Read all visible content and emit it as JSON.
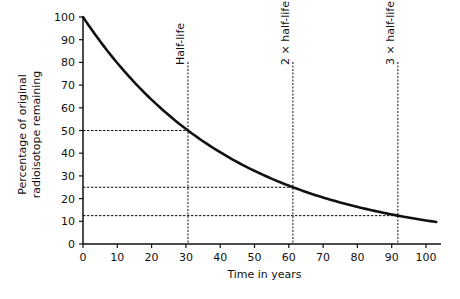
{
  "chart_data": {
    "type": "line",
    "title": "",
    "xlabel": "Time in years",
    "ylabel": [
      "Percentage of original",
      "radioisotope remaining"
    ],
    "xlim": [
      0,
      100
    ],
    "ylim": [
      0,
      100
    ],
    "xticks": [
      0,
      10,
      20,
      30,
      40,
      50,
      60,
      70,
      80,
      90,
      100
    ],
    "yticks": [
      0,
      10,
      20,
      30,
      40,
      50,
      60,
      70,
      80,
      90,
      100
    ],
    "grid": false,
    "legend": "none",
    "half_life_years": 30.6,
    "series": [
      {
        "name": "Radioisotope remaining (%)",
        "color": "#111111",
        "x": [
          0,
          5,
          10,
          15,
          20,
          25,
          30.6,
          35,
          40,
          45,
          50,
          55,
          61.2,
          65,
          70,
          75,
          80,
          85,
          91.8,
          95,
          100,
          103
        ],
        "y": [
          100,
          89.3,
          79.8,
          71.2,
          63.6,
          56.8,
          50,
          45.2,
          40.4,
          36.1,
          32.2,
          28.8,
          25,
          22.9,
          20.5,
          18.3,
          16.3,
          14.5,
          12.5,
          11.6,
          10.6,
          10.3
        ]
      }
    ],
    "annotations": [
      {
        "label": "Half-life",
        "x": 30.6,
        "y": 50
      },
      {
        "label": "2 × half-life",
        "x": 61.2,
        "y": 25
      },
      {
        "label": "3 × half-life",
        "x": 91.8,
        "y": 12.5
      }
    ]
  }
}
